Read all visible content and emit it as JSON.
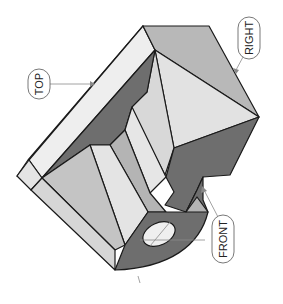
{
  "diagram": {
    "type": "isometric-view-of-machined-part",
    "orientation": "rotated 90deg",
    "labels": {
      "top": "TOP",
      "right": "RIGHT",
      "front": "FRONT"
    },
    "colors": {
      "light_face": "#e6e6e6",
      "lighter_face": "#f0f0f0",
      "mid_face": "#b4b4b4",
      "mid_light_face": "#cccccc",
      "dark_face": "#6e6e6e",
      "edge": "#1a1a1a",
      "leader": "#8a8a8a"
    }
  }
}
